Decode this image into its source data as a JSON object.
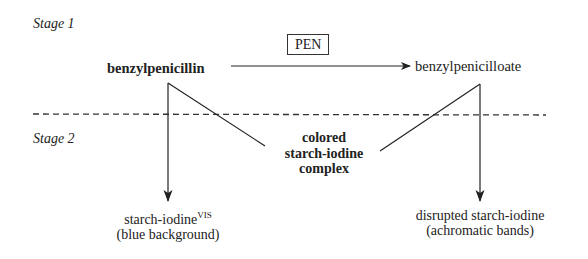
{
  "stages": {
    "stage1_label": "Stage 1",
    "stage2_label": "Stage 2"
  },
  "reaction": {
    "substrate": "benzylpenicillin",
    "enzyme": "PEN",
    "product": "benzylpenicilloate"
  },
  "center_complex": {
    "line1": "colored",
    "line2": "starch-iodine",
    "line3": "complex"
  },
  "outcomes": {
    "left": {
      "line1": "starch-iodine",
      "superscript": "VIS",
      "line2": "(blue background)"
    },
    "right": {
      "line1": "disrupted starch-iodine",
      "line2": "(achromatic bands)"
    }
  }
}
